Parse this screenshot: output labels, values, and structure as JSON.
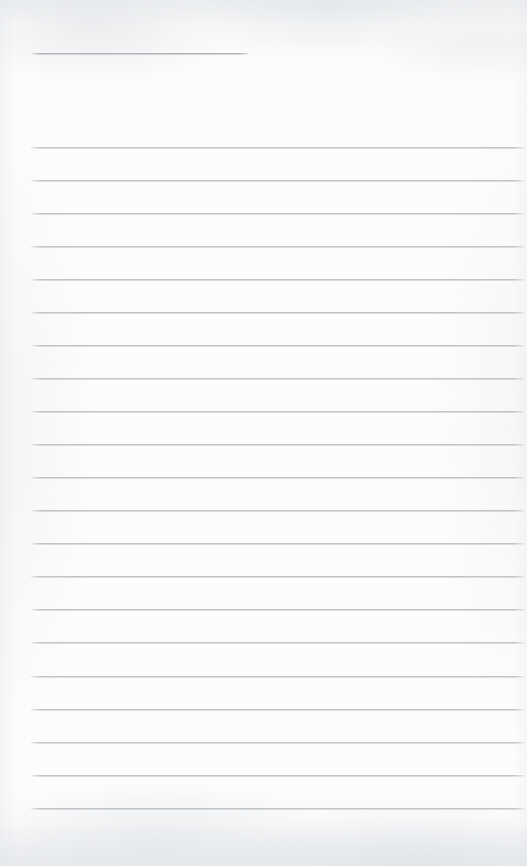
{
  "document": {
    "kind": "scanned-lined-notepaper",
    "title_text": "",
    "body_text": "",
    "is_blank": true,
    "page_width": 527,
    "page_height": 866,
    "paper_color": "#fcfcfc",
    "rule_color": "#b5b9be",
    "header_rule_color": "#a0a4a9"
  },
  "header_rule": {
    "name": "title-rule",
    "x": 30,
    "y": 53,
    "width": 218,
    "thickness": 2
  },
  "ruled_area": {
    "left": 30,
    "right": 524,
    "line_width": 494,
    "first_line_y": 147,
    "line_spacing": 33,
    "line_count": 21,
    "lines": [
      {
        "index": 1,
        "y": 147
      },
      {
        "index": 2,
        "y": 180
      },
      {
        "index": 3,
        "y": 213
      },
      {
        "index": 4,
        "y": 246
      },
      {
        "index": 5,
        "y": 279
      },
      {
        "index": 6,
        "y": 312
      },
      {
        "index": 7,
        "y": 345
      },
      {
        "index": 8,
        "y": 378
      },
      {
        "index": 9,
        "y": 411
      },
      {
        "index": 10,
        "y": 444
      },
      {
        "index": 11,
        "y": 477
      },
      {
        "index": 12,
        "y": 510
      },
      {
        "index": 13,
        "y": 543
      },
      {
        "index": 14,
        "y": 576
      },
      {
        "index": 15,
        "y": 609
      },
      {
        "index": 16,
        "y": 642
      },
      {
        "index": 17,
        "y": 676
      },
      {
        "index": 18,
        "y": 709
      },
      {
        "index": 19,
        "y": 742
      },
      {
        "index": 20,
        "y": 775
      },
      {
        "index": 21,
        "y": 808
      }
    ]
  },
  "margins": {
    "top_blank_height": 53,
    "gap_after_title_rule": 94,
    "bottom_blank_height": 58
  }
}
